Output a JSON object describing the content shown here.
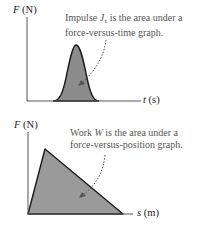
{
  "top_graph": {
    "y_axis_var": "F",
    "y_axis_unit": "(N)",
    "x_axis_var": "t",
    "x_axis_unit": "(s)",
    "caption_line1_pre": "Impulse ",
    "caption_symbol": "J",
    "caption_subscript": "x",
    "caption_line1_post": " is the area under a",
    "caption_line2": "force-versus-time graph.",
    "shape": "bell-shaped pulse",
    "fill_color": "#8c8c8c"
  },
  "bottom_graph": {
    "y_axis_var": "F",
    "y_axis_unit": "(N)",
    "x_axis_var": "s",
    "x_axis_unit": "(m)",
    "caption_line1_pre": "Work ",
    "caption_symbol": "W",
    "caption_line1_post": " is the area under a",
    "caption_line2": "force-versus-position graph.",
    "shape": "triangle",
    "fill_color": "#9a9a9a"
  },
  "colors": {
    "axis": "#555555",
    "outline": "#1a1a1a",
    "arrow": "#555555"
  }
}
